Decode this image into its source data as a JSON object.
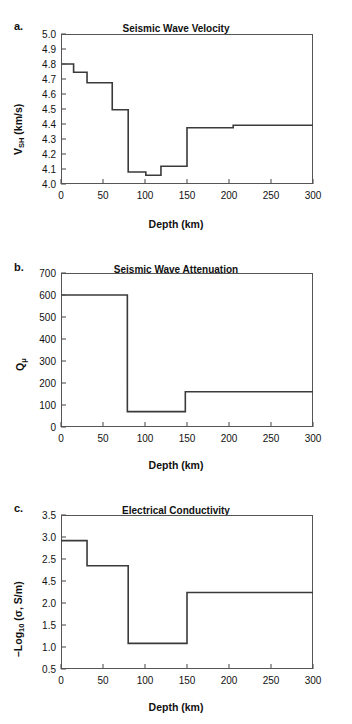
{
  "figure": {
    "panels": [
      {
        "letter": "a.",
        "title": "Seismic Wave Velocity",
        "ylabel_main": "V",
        "ylabel_sub": "SH",
        "ylabel_tail": " (km/s)",
        "xlabel": "Depth (km)",
        "ytick_labels": [
          "5.0",
          "4.9",
          "4.8",
          "4.7",
          "4.6",
          "4.5",
          "4.4",
          "4.3",
          "4.2",
          "4.1",
          "4.0"
        ],
        "xtick_labels": [
          "0",
          "50",
          "100",
          "150",
          "200",
          "250",
          "300"
        ]
      },
      {
        "letter": "b.",
        "title": "Seismic Wave Attenuation",
        "ylabel_main": "Q",
        "ylabel_sub": "μ",
        "ylabel_tail": "",
        "xlabel": "Depth (km)",
        "ytick_labels": [
          "700",
          "600",
          "500",
          "400",
          "300",
          "200",
          "100",
          "0"
        ],
        "xtick_labels": [
          "0",
          "50",
          "100",
          "150",
          "200",
          "250",
          "300"
        ]
      },
      {
        "letter": "c.",
        "title": "Electrical Conductivity",
        "ylabel_main": "–Log",
        "ylabel_sub": "10",
        "ylabel_tail": " (σ, S/m)",
        "xlabel": "Depth (km)",
        "ytick_labels": [
          "3.5",
          "3.0",
          "2.5",
          "4.5",
          "2.0",
          "1.5",
          "1.0",
          "0.5"
        ],
        "xtick_labels": [
          "0",
          "50",
          "100",
          "150",
          "200",
          "250",
          "300"
        ]
      }
    ]
  },
  "chart_data": [
    {
      "type": "line",
      "title": "Seismic Wave Velocity",
      "xlabel": "Depth (km)",
      "ylabel": "V_SH (km/s)",
      "xlim": [
        0,
        300
      ],
      "ylim": [
        4.0,
        5.0
      ],
      "ytick_values": [
        5.0,
        4.9,
        4.8,
        4.7,
        4.6,
        4.5,
        4.4,
        4.3,
        4.2,
        4.1,
        4.0
      ],
      "xtick_values": [
        0,
        50,
        100,
        150,
        200,
        250,
        300
      ],
      "grid": false,
      "legend": "none",
      "step_style": "post",
      "segments": [
        {
          "depth_start": 0,
          "depth_end": 15,
          "value": 4.8
        },
        {
          "depth_start": 15,
          "depth_end": 31,
          "value": 4.745
        },
        {
          "depth_start": 31,
          "depth_end": 61,
          "value": 4.675
        },
        {
          "depth_start": 61,
          "depth_end": 80,
          "value": 4.495
        },
        {
          "depth_start": 80,
          "depth_end": 101,
          "value": 4.08
        },
        {
          "depth_start": 101,
          "depth_end": 119,
          "value": 4.058
        },
        {
          "depth_start": 119,
          "depth_end": 150,
          "value": 4.118
        },
        {
          "depth_start": 150,
          "depth_end": 205,
          "value": 4.375
        },
        {
          "depth_start": 205,
          "depth_end": 300,
          "value": 4.392
        }
      ],
      "x": [
        0,
        15,
        15,
        31,
        31,
        61,
        61,
        80,
        80,
        101,
        101,
        119,
        119,
        150,
        150,
        205,
        205,
        300
      ],
      "y": [
        4.8,
        4.8,
        4.745,
        4.745,
        4.675,
        4.675,
        4.495,
        4.495,
        4.08,
        4.08,
        4.058,
        4.058,
        4.118,
        4.118,
        4.375,
        4.375,
        4.392,
        4.392
      ]
    },
    {
      "type": "line",
      "title": "Seismic Wave Attenuation",
      "xlabel": "Depth (km)",
      "ylabel": "Q_mu",
      "xlim": [
        0,
        300
      ],
      "ylim": [
        0,
        700
      ],
      "ytick_values": [
        700,
        600,
        500,
        400,
        300,
        200,
        100,
        0
      ],
      "xtick_values": [
        0,
        50,
        100,
        150,
        200,
        250,
        300
      ],
      "grid": false,
      "legend": "none",
      "step_style": "post",
      "segments": [
        {
          "depth_start": 0,
          "depth_end": 79,
          "value": 600
        },
        {
          "depth_start": 79,
          "depth_end": 148,
          "value": 70
        },
        {
          "depth_start": 148,
          "depth_end": 300,
          "value": 160
        }
      ],
      "x": [
        0,
        79,
        79,
        148,
        148,
        300
      ],
      "y": [
        600,
        600,
        70,
        70,
        160,
        160
      ]
    },
    {
      "type": "line",
      "title": "Electrical Conductivity",
      "xlabel": "Depth (km)",
      "ylabel": "-Log10 (sigma, S/m)",
      "xlim": [
        0,
        300
      ],
      "ylim": [
        0.5,
        3.5
      ],
      "ytick_values": [
        3.5,
        3.0,
        2.5,
        2.0,
        2.0,
        1.5,
        1.0,
        0.5
      ],
      "ytick_labels_as_printed": [
        "3.5",
        "3.0",
        "2.5",
        "4.5",
        "2.0",
        "1.5",
        "1.0",
        "0.5"
      ],
      "xtick_values": [
        0,
        50,
        100,
        150,
        200,
        250,
        300
      ],
      "grid": false,
      "legend": "none",
      "step_style": "post",
      "segments": [
        {
          "depth_start": 0,
          "depth_end": 31,
          "value": 3.0
        },
        {
          "depth_start": 31,
          "depth_end": 80,
          "value": 2.51
        },
        {
          "depth_start": 80,
          "depth_end": 150,
          "value": 1.0
        },
        {
          "depth_start": 150,
          "depth_end": 300,
          "value": 1.99
        }
      ],
      "x": [
        0,
        31,
        31,
        80,
        80,
        150,
        150,
        300
      ],
      "y": [
        3.0,
        3.0,
        2.51,
        2.51,
        1.0,
        1.0,
        1.99,
        1.99
      ]
    }
  ],
  "style": {
    "line_color": "#3a3a3a",
    "frame_color": "#555555",
    "text_color": "#111111",
    "background": "#ffffff"
  }
}
